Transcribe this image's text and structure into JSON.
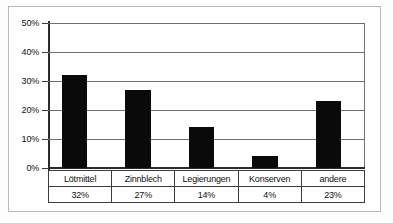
{
  "chart_data": {
    "type": "bar",
    "title": "",
    "subtitle": "",
    "xlabel": "",
    "ylabel": "",
    "categories": [
      "Lötmittel",
      "Zinnblech",
      "Legierungen",
      "Konserven",
      "andere"
    ],
    "values": [
      32,
      27,
      14,
      4,
      23
    ],
    "value_labels": [
      "32%",
      "27%",
      "14%",
      "4%",
      "23%"
    ],
    "ylim": [
      0,
      50
    ],
    "y_ticks": [
      0,
      10,
      20,
      30,
      40,
      50
    ],
    "y_tick_labels": [
      "0%",
      "10%",
      "20%",
      "30%",
      "40%",
      "50%"
    ],
    "grid": true,
    "legend": false,
    "legend_position": "none",
    "series": [
      {
        "name": "Anteil",
        "values": [
          32,
          27,
          14,
          4,
          23
        ],
        "color": "#0a0a0a"
      }
    ],
    "annotations": [],
    "table_below_axis": true,
    "table_rows": [
      {
        "row_name": "categories",
        "cells": [
          "Lötmittel",
          "Zinnblech",
          "Legierungen",
          "Konserven",
          "andere"
        ]
      },
      {
        "row_name": "values",
        "cells": [
          "32%",
          "27%",
          "14%",
          "4%",
          "23%"
        ]
      }
    ]
  },
  "colors": {
    "bar": "#0a0a0a",
    "gridline": "#6e6e6e",
    "axis": "#2b2b2b",
    "frame": "#b9b9b9",
    "table_border": "#3c3c3c",
    "background": "#ffffff",
    "text": "#111111"
  }
}
